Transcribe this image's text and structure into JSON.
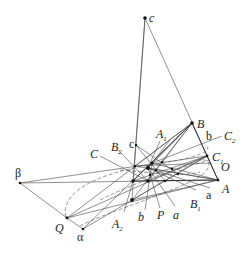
{
  "diagram": {
    "type": "projective-geometry-construction",
    "colors": {
      "line": "#444444",
      "point": "#111111",
      "background": "#ffffff"
    },
    "labels": {
      "c_top": "c",
      "c_small": "c",
      "B": "B",
      "b_upright": "b",
      "C2": "C",
      "C2_sub": "2",
      "C1": "C",
      "C1_sub": "1",
      "O": "O",
      "A": "A",
      "a_upright": "a",
      "B1": "B",
      "B1_sub": "1",
      "a_italic": "a",
      "P": "P",
      "b_italic": "b",
      "A2": "A",
      "A2_sub": "2",
      "alpha": "α",
      "Q": "Q",
      "beta": "β",
      "C": "C",
      "B2": "B",
      "B2_sub": "2",
      "A1": "A",
      "A1_sub": "1"
    },
    "points": [
      {
        "name": "c",
        "x": 145,
        "y": 18
      },
      {
        "name": "B",
        "x": 192,
        "y": 123
      },
      {
        "name": "C1",
        "x": 207,
        "y": 156
      },
      {
        "name": "A",
        "x": 218,
        "y": 180
      },
      {
        "name": "beta",
        "x": 20,
        "y": 183
      },
      {
        "name": "Q",
        "x": 67,
        "y": 218
      },
      {
        "name": "alpha",
        "x": 83,
        "y": 229
      },
      {
        "name": "c_small",
        "x": 136,
        "y": 145
      },
      {
        "name": "A2",
        "x": 132,
        "y": 200
      },
      {
        "name": "X1",
        "x": 133,
        "y": 181
      },
      {
        "name": "X2",
        "x": 148,
        "y": 181
      },
      {
        "name": "X3",
        "x": 148,
        "y": 168
      },
      {
        "name": "X4",
        "x": 152,
        "y": 163
      },
      {
        "name": "X5",
        "x": 135,
        "y": 166
      },
      {
        "name": "X6",
        "x": 162,
        "y": 162
      },
      {
        "name": "X7",
        "x": 156,
        "y": 170
      },
      {
        "name": "X8",
        "x": 172,
        "y": 169
      },
      {
        "name": "X9",
        "x": 178,
        "y": 174
      },
      {
        "name": "X10",
        "x": 165,
        "y": 181
      }
    ]
  }
}
